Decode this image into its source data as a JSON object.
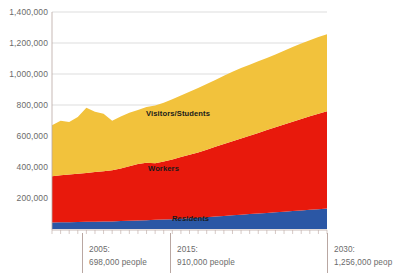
{
  "chart_data": {
    "type": "area",
    "title": "",
    "xlabel": "",
    "ylabel": "",
    "stacked": true,
    "grid": true,
    "legend_position": "inline",
    "ylim": [
      0,
      1400000
    ],
    "xlim": [
      1998,
      2030
    ],
    "ytick_labels": [
      "1,400,000",
      "1,200,000",
      "1,000,000",
      "800,000",
      "600,000",
      "400,000",
      "200,000"
    ],
    "ytick_values": [
      1400000,
      1200000,
      1000000,
      800000,
      600000,
      400000,
      200000
    ],
    "x": [
      1998,
      1999,
      2000,
      2001,
      2002,
      2003,
      2004,
      2005,
      2006,
      2007,
      2008,
      2009,
      2010,
      2011,
      2012,
      2013,
      2014,
      2015,
      2016,
      2017,
      2018,
      2019,
      2020,
      2021,
      2022,
      2023,
      2024,
      2025,
      2026,
      2027,
      2028,
      2029,
      2030
    ],
    "series": [
      {
        "name": "Residents",
        "color": "#2b57a5",
        "values": [
          42000,
          43000,
          44000,
          45000,
          46000,
          47000,
          48000,
          49000,
          51000,
          53000,
          55000,
          57000,
          59000,
          61000,
          63000,
          66000,
          69000,
          72000,
          76000,
          80000,
          84000,
          88000,
          92000,
          96000,
          100000,
          104000,
          108000,
          112000,
          116000,
          120000,
          124000,
          128000,
          132000
        ]
      },
      {
        "name": "Workers",
        "color": "#e8190c",
        "values": [
          298000,
          303000,
          308000,
          312000,
          316000,
          320000,
          324000,
          330000,
          340000,
          352000,
          364000,
          370000,
          366000,
          374000,
          386000,
          398000,
          410000,
          422000,
          436000,
          450000,
          464000,
          478000,
          492000,
          506000,
          520000,
          534000,
          548000,
          562000,
          576000,
          590000,
          604000,
          616000,
          628000
        ]
      },
      {
        "name": "Visitors/Students",
        "color": "#f2c23c",
        "values": [
          330000,
          352000,
          338000,
          366000,
          420000,
          390000,
          372000,
          319000,
          334000,
          345000,
          348000,
          360000,
          372000,
          380000,
          388000,
          398000,
          406000,
          416000,
          424000,
          432000,
          440000,
          448000,
          454000,
          458000,
          462000,
          466000,
          470000,
          476000,
          482000,
          486000,
          490000,
          494000,
          496000
        ]
      }
    ],
    "annotations": [
      {
        "year": "2005:",
        "total": "698,000 people",
        "x_value": 2005
      },
      {
        "year": "2015:",
        "total": "910,000 people",
        "x_value": 2015
      },
      {
        "year": "2030:",
        "total": "1,256,000 peop",
        "x_value": 2030
      }
    ]
  }
}
